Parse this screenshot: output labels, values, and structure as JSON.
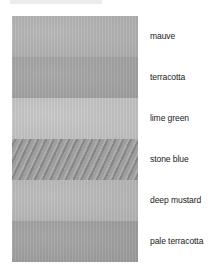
{
  "swatches": [
    {
      "label": "mauve",
      "color": "#b4b4b4",
      "texture": "mottled"
    },
    {
      "label": "terracotta",
      "color": "#a4a4a4",
      "texture": "mottled"
    },
    {
      "label": "lime green",
      "color": "#c6c6c6",
      "texture": "mottled"
    },
    {
      "label": "stone blue",
      "color": "#999999",
      "texture": "streaked"
    },
    {
      "label": "deep mustard",
      "color": "#bababa",
      "texture": "mottled"
    },
    {
      "label": "pale terracotta",
      "color": "#a1a1a1",
      "texture": "mottled"
    }
  ]
}
